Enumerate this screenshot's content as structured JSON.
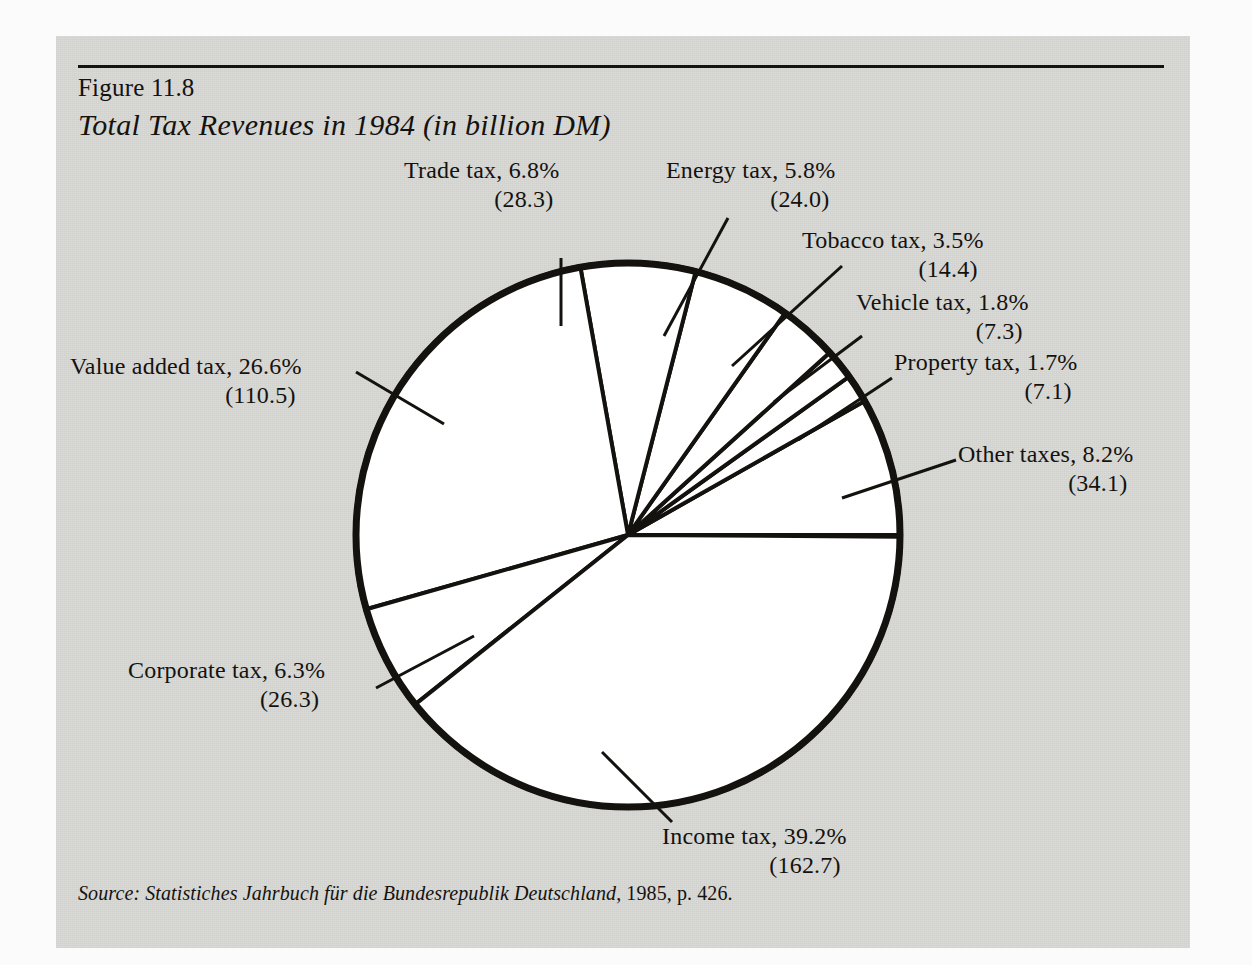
{
  "figure": {
    "number_label": "Figure 11.8",
    "title": "Total Tax Revenues in 1984 (in billion DM)",
    "source_prefix": "Source: Statistiches Jahrbuch für die Bundesrepublik Deutschland",
    "source_suffix": ", 1985, p. 426.",
    "panel_color": "#d9d9d6",
    "ink_color": "#14120e",
    "slice_fill": "#ffffff"
  },
  "chart_data": {
    "type": "pie",
    "title": "Total Tax Revenues in 1984 (in billion DM)",
    "units": "billion DM",
    "total": 414.7,
    "start_angle_deg": 0,
    "direction": "counterclockwise",
    "legend": "none (direct labels with leader lines)",
    "grid": false,
    "categories": [
      "Other taxes",
      "Property tax",
      "Vehicle tax",
      "Tobacco tax",
      "Energy tax",
      "Trade tax",
      "Value added tax",
      "Corporate tax",
      "Income tax"
    ],
    "percents": [
      8.2,
      1.7,
      1.8,
      3.5,
      5.8,
      6.8,
      26.6,
      6.3,
      39.2
    ],
    "values": [
      34.1,
      7.1,
      7.3,
      14.4,
      24.0,
      28.3,
      110.5,
      26.3,
      162.7
    ],
    "slices": [
      {
        "label": "Other taxes",
        "percent": "8.2%",
        "value": "(34.1)",
        "pct": 8.2,
        "val": 34.1
      },
      {
        "label": "Property tax",
        "percent": "1.7%",
        "value": "(7.1)",
        "pct": 1.7,
        "val": 7.1
      },
      {
        "label": "Vehicle tax",
        "percent": "1.8%",
        "value": "(7.3)",
        "pct": 1.8,
        "val": 7.3
      },
      {
        "label": "Tobacco tax",
        "percent": "3.5%",
        "value": "(14.4)",
        "pct": 3.5,
        "val": 14.4
      },
      {
        "label": "Energy tax",
        "percent": "5.8%",
        "value": "(24.0)",
        "pct": 5.8,
        "val": 24.0
      },
      {
        "label": "Trade tax",
        "percent": "6.8%",
        "value": "(28.3)",
        "pct": 6.8,
        "val": 28.3
      },
      {
        "label": "Value added tax",
        "percent": "26.6%",
        "value": "(110.5)",
        "pct": 26.6,
        "val": 110.5
      },
      {
        "label": "Corporate tax",
        "percent": "6.3%",
        "value": "(26.3)",
        "pct": 6.3,
        "val": 26.3
      },
      {
        "label": "Income tax",
        "percent": "39.2%",
        "value": "(162.7)",
        "pct": 39.2,
        "val": 162.7
      }
    ]
  },
  "callouts": {
    "trade": {
      "line1": "Trade tax, 6.8%",
      "line2": "(28.3)"
    },
    "energy": {
      "line1": "Energy tax, 5.8%",
      "line2": "(24.0)"
    },
    "tobacco": {
      "line1": "Tobacco tax, 3.5%",
      "line2": "(14.4)"
    },
    "vehicle": {
      "line1": "Vehicle tax, 1.8%",
      "line2": "(7.3)"
    },
    "property": {
      "line1": "Property tax, 1.7%",
      "line2": "(7.1)"
    },
    "other": {
      "line1": "Other taxes, 8.2%",
      "line2": "(34.1)"
    },
    "value_added": {
      "line1": "Value added tax, 26.6%",
      "line2": "(110.5)"
    },
    "corporate": {
      "line1": "Corporate tax, 6.3%",
      "line2": "(26.3)"
    },
    "income": {
      "line1": "Income tax, 39.2%",
      "line2": "(162.7)"
    }
  }
}
